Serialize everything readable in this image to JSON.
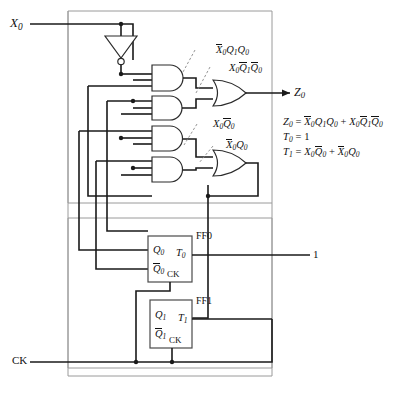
{
  "figure": {
    "title": "Sequential circuit realization with two T flip-flops",
    "type": "logic-circuit-schematic"
  },
  "inputs": [
    {
      "name": "input-x0",
      "label": "X",
      "sub": "0",
      "x": 10,
      "y": 16
    },
    {
      "name": "input-ck",
      "label": "CK",
      "sub": "",
      "x": 12,
      "y": 355
    }
  ],
  "outputs": [
    {
      "name": "output-z0",
      "label": "Z",
      "sub": "0",
      "x": 294,
      "y": 86
    }
  ],
  "constants": [
    {
      "name": "logic-one-t0",
      "label": "1",
      "x": 313,
      "y": 249
    }
  ],
  "gate_labels": [
    {
      "name": "and-gate-1-label",
      "x": 216,
      "y": 45,
      "terms": [
        {
          "text": "X",
          "sub": "0",
          "bar": true
        },
        {
          "text": "Q",
          "sub": "1",
          "bar": false
        },
        {
          "text": "Q",
          "sub": "0",
          "bar": false
        }
      ]
    },
    {
      "name": "and-gate-2-label",
      "x": 229,
      "y": 63,
      "terms": [
        {
          "text": "X",
          "sub": "0",
          "bar": false
        },
        {
          "text": "Q",
          "sub": "1",
          "bar": true
        },
        {
          "text": "Q",
          "sub": "0",
          "bar": true
        }
      ]
    },
    {
      "name": "and-gate-3-label",
      "x": 213,
      "y": 119,
      "terms": [
        {
          "text": "X",
          "sub": "0",
          "bar": false
        },
        {
          "text": "Q",
          "sub": "0",
          "bar": true
        }
      ]
    },
    {
      "name": "and-gate-4-label",
      "x": 226,
      "y": 140,
      "terms": [
        {
          "text": "X",
          "sub": "0",
          "bar": true
        },
        {
          "text": "Q",
          "sub": "0",
          "bar": false
        }
      ]
    }
  ],
  "flipflops": [
    {
      "name": "flip-flop-0",
      "id": "FF0",
      "id_x": 196,
      "id_y": 231,
      "box": {
        "x": 148,
        "y": 236,
        "w": 44,
        "h": 46
      },
      "pins": [
        {
          "name": "ff0-q-input",
          "label": "Q",
          "sub": "0",
          "bar": false,
          "x": 153,
          "y": 245
        },
        {
          "name": "ff0-qbar-input",
          "label": "Q",
          "sub": "0",
          "bar": true,
          "x": 153,
          "y": 264
        },
        {
          "name": "ff0-ck-input",
          "label": "CK",
          "sub": "",
          "bar": false,
          "x": 167,
          "y": 270
        },
        {
          "name": "ff0-t-output",
          "label": "T",
          "sub": "0",
          "bar": false,
          "x": 176,
          "y": 252
        }
      ]
    },
    {
      "name": "flip-flop-1",
      "id": "FF1",
      "id_x": 196,
      "id_y": 296,
      "box": {
        "x": 150,
        "y": 300,
        "w": 42,
        "h": 48
      },
      "pins": [
        {
          "name": "ff1-q-input",
          "label": "Q",
          "sub": "1",
          "bar": false,
          "x": 155,
          "y": 310
        },
        {
          "name": "ff1-qbar-input",
          "label": "Q",
          "sub": "1",
          "bar": true,
          "x": 155,
          "y": 329
        },
        {
          "name": "ff1-ck-input",
          "label": "CK",
          "sub": "",
          "bar": false,
          "x": 169,
          "y": 336
        },
        {
          "name": "ff1-t-output",
          "label": "T",
          "sub": "1",
          "bar": false,
          "x": 178,
          "y": 317
        }
      ]
    }
  ],
  "equations": {
    "x": 283,
    "y": 117,
    "line_height": 15,
    "items": [
      {
        "name": "equation-z0",
        "lhs": {
          "text": "Z",
          "sub": "0"
        },
        "rhs": [
          {
            "text": "X",
            "sub": "0",
            "bar": true
          },
          {
            "text": "Q",
            "sub": "1",
            "bar": false
          },
          {
            "text": "Q",
            "sub": "0",
            "bar": false
          },
          {
            "op": "+"
          },
          {
            "text": "X",
            "sub": "0",
            "bar": false
          },
          {
            "text": "Q",
            "sub": "1",
            "bar": true
          },
          {
            "text": "Q",
            "sub": "0",
            "bar": true
          }
        ]
      },
      {
        "name": "equation-t0",
        "lhs": {
          "text": "T",
          "sub": "0"
        },
        "rhs": [
          {
            "text": "1",
            "sub": "",
            "plain": true
          }
        ]
      },
      {
        "name": "equation-t1",
        "lhs": {
          "text": "T",
          "sub": "1"
        },
        "rhs": [
          {
            "text": "X",
            "sub": "0",
            "bar": false
          },
          {
            "text": "Q",
            "sub": "0",
            "bar": true
          },
          {
            "op": "+"
          },
          {
            "text": "X",
            "sub": "0",
            "bar": true
          },
          {
            "text": "Q",
            "sub": "0",
            "bar": false
          }
        ]
      }
    ]
  },
  "colors": {
    "wire": "#1a1a1a",
    "wire_thin": "#555555",
    "frame": "#8a8a8a",
    "gate_stroke": "#2b2b2b",
    "leader": "#777777",
    "background": "#ffffff"
  }
}
